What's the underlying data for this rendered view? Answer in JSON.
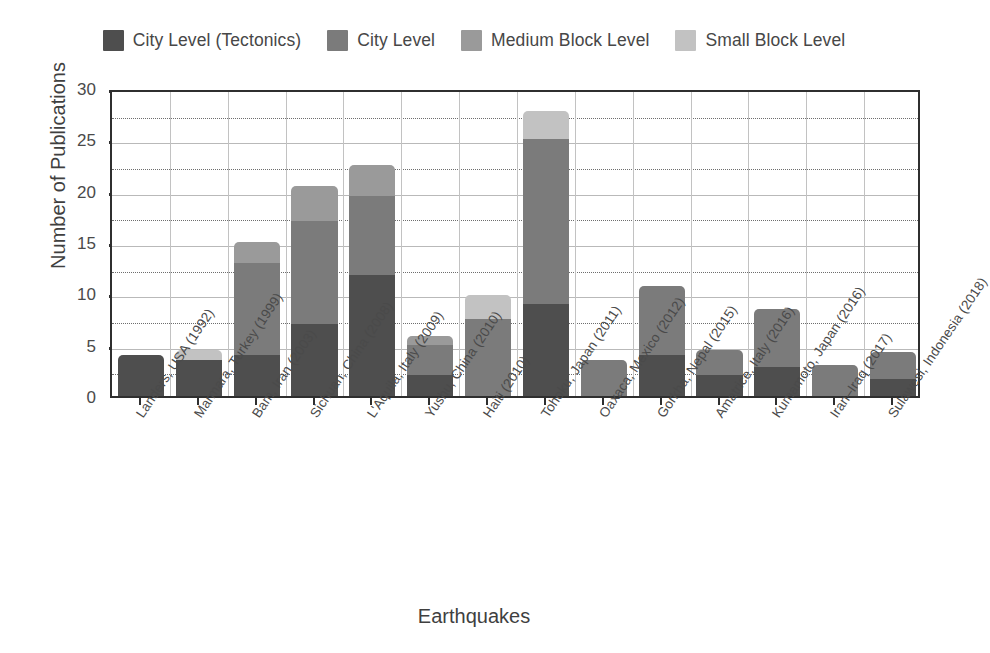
{
  "chart_data": {
    "type": "bar",
    "subtype": "stacked-bar",
    "title": "",
    "xlabel": "Earthquakes",
    "ylabel": "Number of Publications",
    "ylim": [
      0,
      30
    ],
    "yticks": [
      0,
      5,
      10,
      15,
      20,
      25,
      30
    ],
    "yticklabels": [
      "0",
      "5",
      "10",
      "15",
      "20",
      "25",
      "30"
    ],
    "minor_gridlines": [
      2.5,
      7.5,
      12.5,
      17.5,
      22.5,
      27.5
    ],
    "grid": true,
    "legend_position": "top",
    "categories": [
      "Landers, USA (1992)",
      "Marmara, Turkey (1999)",
      "Bam, Iran (2003)",
      "Sichuan, China (2008)",
      "L'Aquila, Italy (2009)",
      "Yushu, China (2010)",
      "Haiti (2010)",
      "Tohoku, Japan (2011)",
      "Oaxaca, Mexico (2012)",
      "Gorkha, Nepal (2015)",
      "Amatrice, Italy (2016)",
      "Kumamoto, Japan (2016)",
      "Iran–Iraq (2017)",
      "Sulawesi, Indonesia (2018)"
    ],
    "series": [
      {
        "name": "City Level (Tectonics)",
        "color": "#4e4e4e",
        "values": [
          4,
          3.5,
          4,
          7,
          11.8,
          2,
          0,
          9,
          0,
          4,
          2,
          2.8,
          0,
          1.7
        ]
      },
      {
        "name": "City Level",
        "color": "#7b7b7b",
        "values": [
          0,
          0,
          9,
          10,
          7.7,
          3,
          7.5,
          16,
          3.5,
          6.7,
          2.5,
          5.7,
          3,
          2.6
        ]
      },
      {
        "name": "Medium Block Level",
        "color": "#9a9a9a",
        "values": [
          0,
          0,
          2,
          3.5,
          3,
          0.8,
          0,
          0,
          0,
          0,
          0,
          0,
          0,
          0
        ]
      },
      {
        "name": "Small Block Level",
        "color": "#c2c2c2",
        "values": [
          0,
          1,
          0,
          0,
          0,
          0,
          2.3,
          2.8,
          0,
          0,
          0,
          0,
          0,
          0
        ]
      }
    ],
    "totals": [
      4,
      4.5,
      15,
      20.5,
      22.5,
      5.8,
      9.8,
      27.8,
      3.5,
      10.7,
      4.5,
      8.5,
      3,
      4.3
    ]
  },
  "legend": {
    "items": [
      {
        "label": "City Level (Tectonics)",
        "color": "#4e4e4e"
      },
      {
        "label": "City Level",
        "color": "#7b7b7b"
      },
      {
        "label": "Medium Block Level",
        "color": "#9a9a9a"
      },
      {
        "label": "Small Block Level",
        "color": "#c2c2c2"
      }
    ]
  },
  "axes": {
    "y_title": "Number of Publications",
    "x_title": "Earthquakes"
  }
}
